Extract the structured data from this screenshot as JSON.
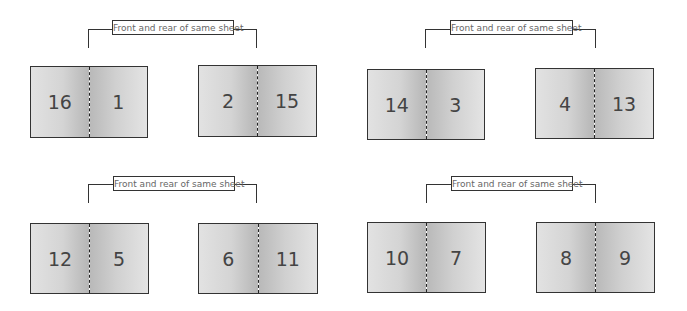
{
  "diagram": {
    "type": "booklet-imposition",
    "groups": [
      {
        "label": "Front and rear of same sheet",
        "sheets": [
          {
            "left_page": "16",
            "right_page": "1"
          },
          {
            "left_page": "2",
            "right_page": "15"
          }
        ]
      },
      {
        "label": "Front and rear of same sheet",
        "sheets": [
          {
            "left_page": "14",
            "right_page": "3"
          },
          {
            "left_page": "4",
            "right_page": "13"
          }
        ]
      },
      {
        "label": "Front and rear of same sheet",
        "sheets": [
          {
            "left_page": "12",
            "right_page": "5"
          },
          {
            "left_page": "6",
            "right_page": "11"
          }
        ]
      },
      {
        "label": "Front and rear of same sheet",
        "sheets": [
          {
            "left_page": "10",
            "right_page": "7"
          },
          {
            "left_page": "8",
            "right_page": "9"
          }
        ]
      }
    ]
  }
}
